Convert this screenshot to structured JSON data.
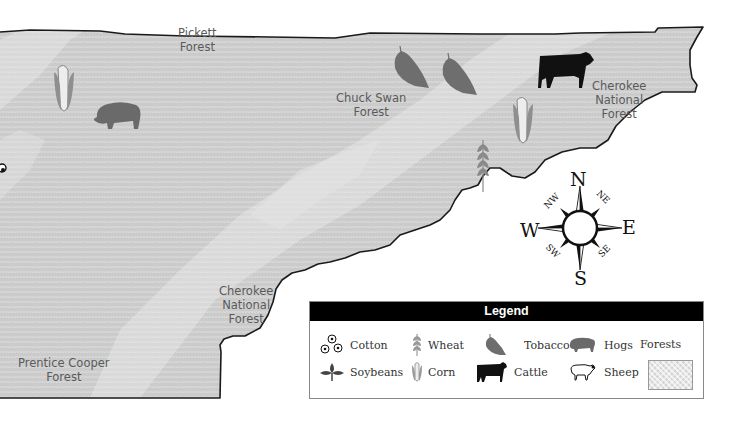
{
  "map": {
    "region_fill": "#cfcfcf",
    "forest_band_fill": "#e0e0e0",
    "border_color": "#222222",
    "labels": [
      {
        "id": "pickett",
        "text_lines": [
          "Pickett",
          "Forest"
        ],
        "x": 178,
        "y": 26
      },
      {
        "id": "chuck-swan",
        "text_lines": [
          "Chuck Swan",
          "Forest"
        ],
        "x": 335,
        "y": 92
      },
      {
        "id": "cherokee-ne",
        "text_lines": [
          "Cherokee",
          "National",
          "Forest"
        ],
        "x": 590,
        "y": 80
      },
      {
        "id": "cherokee-sw",
        "text_lines": [
          "Cherokee",
          "National",
          "Forest"
        ],
        "x": 218,
        "y": 285
      },
      {
        "id": "prentice-cooper",
        "text_lines": [
          "Prentice Cooper",
          "Forest"
        ],
        "x": 16,
        "y": 356
      }
    ],
    "symbols": [
      {
        "type": "corn",
        "x": 52,
        "y": 64
      },
      {
        "type": "hogs",
        "x": 92,
        "y": 99
      },
      {
        "type": "tobacco",
        "x": 393,
        "y": 46
      },
      {
        "type": "tobacco",
        "x": 441,
        "y": 53
      },
      {
        "type": "cattle",
        "x": 538,
        "y": 52
      },
      {
        "type": "corn",
        "x": 511,
        "y": 96
      },
      {
        "type": "wheat",
        "x": 475,
        "y": 140
      }
    ]
  },
  "compass": {
    "N": "N",
    "S": "S",
    "E": "E",
    "W": "W",
    "NE": "NE",
    "NW": "NW",
    "SE": "SE",
    "SW": "SW"
  },
  "legend": {
    "title": "Legend",
    "items": [
      {
        "id": "cotton",
        "label": "Cotton"
      },
      {
        "id": "wheat",
        "label": "Wheat"
      },
      {
        "id": "tobacco",
        "label": "Tobacco"
      },
      {
        "id": "hogs",
        "label": "Hogs"
      },
      {
        "id": "soybeans",
        "label": "Soybeans"
      },
      {
        "id": "corn",
        "label": "Corn"
      },
      {
        "id": "cattle",
        "label": "Cattle"
      },
      {
        "id": "sheep",
        "label": "Sheep"
      }
    ],
    "forests_label": "Forests"
  },
  "colors": {
    "tobacco": "#6e6e6e",
    "hogs": "#6a6a6a",
    "cattle": "#111111",
    "wheat": "#8a8a8a",
    "corn_husk": "#8f8f8f",
    "corn_cob": "#ededed"
  }
}
